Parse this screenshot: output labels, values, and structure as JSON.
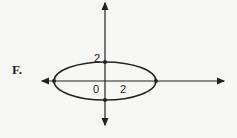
{
  "option_label": "F.",
  "graph": {
    "type": "ellipse",
    "center": [
      0,
      0
    ],
    "x_intercept_label": "2",
    "y_intercept_label": "2",
    "origin_label": "0",
    "semi_axis_x": 4,
    "semi_axis_y": 2
  }
}
